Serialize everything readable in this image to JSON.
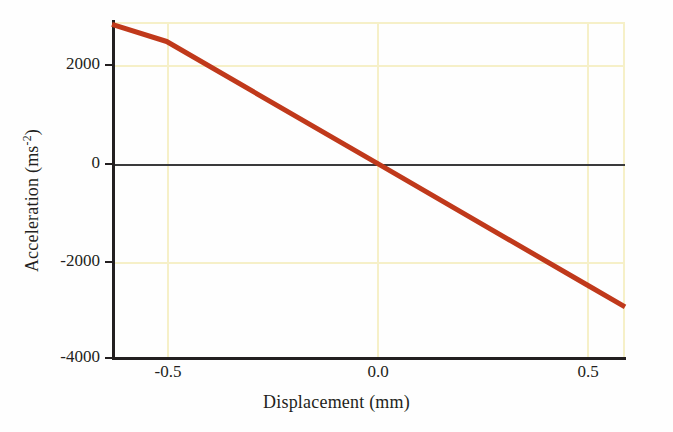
{
  "chart_data": {
    "type": "line",
    "title": "",
    "xlabel": "Displacement (mm)",
    "xlabel_plain": "Displacement (mm)",
    "ylabel": "Acceleration (ms-2)",
    "ylabel_base": "Acceleration (ms",
    "ylabel_exponent": "-2",
    "ylabel_close": ")",
    "xlim": [
      -0.63,
      0.59
    ],
    "ylim": [
      -4000,
      2900
    ],
    "xticks": [
      -0.5,
      0.0,
      0.5
    ],
    "xticklabels": [
      "-0.5",
      "0.0",
      "0.5"
    ],
    "yticks": [
      2000,
      0,
      -2000,
      -4000
    ],
    "yticklabels": [
      "2000",
      "0",
      "-2000",
      "-4000"
    ],
    "grid": true,
    "grid_color": "#f6f0c8",
    "legend": null,
    "series": [
      {
        "name": "acceleration",
        "color": "#c0391b",
        "line_width": 5,
        "x": [
          -0.63,
          -0.5,
          0.0,
          0.5,
          0.59
        ],
        "values": [
          2850,
          2500,
          0,
          -2500,
          -2950
        ]
      }
    ],
    "annotations": [
      {
        "name": "zero-reference-line",
        "y": 0,
        "color": "#3a3a3c"
      }
    ]
  },
  "axes": {
    "spine_color": "#231f20",
    "background": "#fefefe"
  }
}
